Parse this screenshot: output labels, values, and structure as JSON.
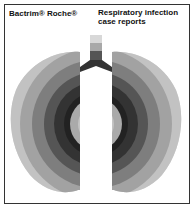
{
  "ad": {
    "brand": "Bactrim® Roche®",
    "headline_line1": "Respiratory infection",
    "headline_line2": "case reports"
  },
  "illustration": {
    "subject": "lungs-concentric-rings-icon",
    "ring_colors": [
      "#d8d8d8",
      "#bdbdbd",
      "#a0a0a0",
      "#808080",
      "#5e5e5e",
      "#3a3a3a",
      "#2a2a2a",
      "#8a8a8a",
      "#b0b0b0"
    ]
  }
}
